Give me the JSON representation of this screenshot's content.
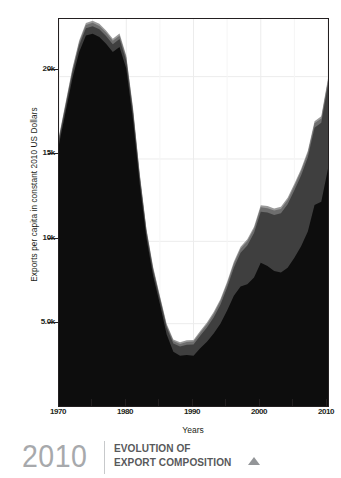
{
  "axes": {
    "ylabel": "Exports per capita in constant 2010 US Dollars",
    "xlabel": "Years",
    "yticks": [
      "20k",
      "15k",
      "10k",
      "5.0k"
    ],
    "xticks": [
      "1970",
      "1980",
      "1990",
      "2000",
      "2010"
    ]
  },
  "caption": {
    "year": "2010",
    "line1": "EVOLUTION OF",
    "line2": "EXPORT COMPOSITION",
    "marker": "triangle-up-icon"
  },
  "colors": {
    "series_black": "#0d0d0d",
    "series_dark_gray": "#3f3f3f",
    "series_mid_gray": "#6e6e6e",
    "series_light_gray": "#9a9a9a",
    "grid": "#ececec",
    "frame": "#231f20",
    "caption_year": "#a7a9ac",
    "caption_text": "#58595b"
  },
  "chart_data": {
    "type": "area",
    "title": "EVOLUTION OF EXPORT COMPOSITION",
    "xlabel": "Years",
    "ylabel": "Exports per capita in constant 2010 US Dollars",
    "xlim": [
      1970,
      2010
    ],
    "ylim": [
      0,
      23500
    ],
    "ytick_values": [
      5000,
      10000,
      15000,
      20000
    ],
    "ytick_labels": [
      "5.0k",
      "10k",
      "15k",
      "20k"
    ],
    "xtick_values": [
      1970,
      1980,
      1990,
      2000,
      2010
    ],
    "grid": true,
    "legend": "none",
    "stacked": true,
    "x": [
      1970,
      1971,
      1972,
      1973,
      1974,
      1975,
      1976,
      1977,
      1978,
      1979,
      1980,
      1981,
      1982,
      1983,
      1984,
      1985,
      1986,
      1987,
      1988,
      1989,
      1990,
      1991,
      1992,
      1993,
      1994,
      1995,
      1996,
      1997,
      1998,
      1999,
      2000,
      2001,
      2002,
      2003,
      2004,
      2005,
      2006,
      2007,
      2008,
      2009,
      2010
    ],
    "series": [
      {
        "name": "Series 1",
        "color": "#0d0d0d",
        "values": [
          15900,
          17900,
          19900,
          21500,
          22500,
          22600,
          22400,
          22000,
          21500,
          21800,
          20500,
          17400,
          13500,
          10200,
          7900,
          6200,
          4350,
          3300,
          3050,
          3100,
          3050,
          3500,
          3900,
          4400,
          5000,
          5800,
          6700,
          7250,
          7400,
          7800,
          8700,
          8500,
          8200,
          8100,
          8400,
          9000,
          9700,
          10600,
          12200,
          12400,
          14400
        ]
      },
      {
        "name": "Series 2",
        "color": "#3f3f3f",
        "values": [
          300,
          330,
          360,
          400,
          440,
          460,
          470,
          470,
          470,
          480,
          470,
          430,
          380,
          340,
          320,
          300,
          420,
          500,
          560,
          620,
          680,
          760,
          860,
          980,
          1150,
          1400,
          1700,
          2050,
          2350,
          2700,
          3100,
          3250,
          3400,
          3600,
          3850,
          4100,
          4300,
          4500,
          4700,
          4800,
          5100
        ]
      },
      {
        "name": "Series 3",
        "color": "#6e6e6e",
        "values": [
          120,
          140,
          160,
          180,
          200,
          210,
          210,
          210,
          210,
          210,
          200,
          180,
          160,
          140,
          130,
          120,
          140,
          150,
          160,
          170,
          180,
          190,
          200,
          210,
          220,
          230,
          240,
          250,
          255,
          260,
          265,
          265,
          265,
          265,
          265,
          265,
          265,
          265,
          265,
          265,
          265
        ]
      },
      {
        "name": "Series 4",
        "color": "#9a9a9a",
        "values": [
          80,
          90,
          100,
          110,
          120,
          125,
          125,
          125,
          125,
          125,
          120,
          110,
          100,
          90,
          85,
          80,
          85,
          90,
          95,
          100,
          100,
          105,
          110,
          115,
          118,
          120,
          122,
          124,
          125,
          126,
          128,
          128,
          128,
          128,
          128,
          128,
          128,
          128,
          128,
          128,
          128
        ]
      }
    ]
  }
}
